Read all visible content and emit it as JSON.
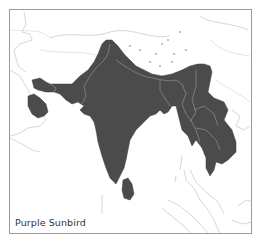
{
  "map": {
    "title": "Purple Sunbird",
    "range_color": "#4b4b4b",
    "background_color": "#ffffff",
    "coastline_color": "#c4c4c4",
    "frame_color": "#9a9a9a"
  }
}
